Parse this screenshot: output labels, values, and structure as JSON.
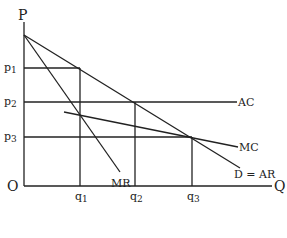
{
  "diagram": {
    "axes": {
      "y_label": "P",
      "x_label": "Q",
      "origin_label": "O"
    },
    "price_levels": [
      {
        "base": "p",
        "sub": "1"
      },
      {
        "base": "p",
        "sub": "2"
      },
      {
        "base": "p",
        "sub": "3"
      }
    ],
    "quantity_levels": [
      {
        "base": "q",
        "sub": "1"
      },
      {
        "base": "q",
        "sub": "2"
      },
      {
        "base": "q",
        "sub": "3"
      }
    ],
    "curves": {
      "ac": "AC",
      "mc": "MC",
      "mr": "MR",
      "demand": "D = AR"
    }
  }
}
